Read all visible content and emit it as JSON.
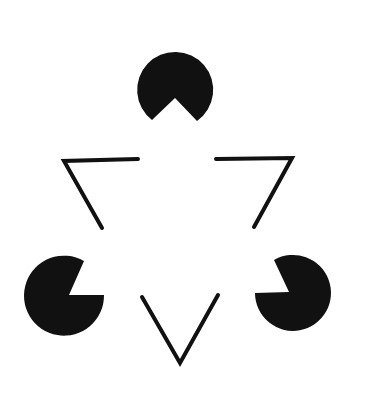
{
  "figure": {
    "name": "Kanizsa triangle illusion",
    "background": "#ffffff",
    "ink": "#111111",
    "width": 365,
    "height": 400,
    "pacmen": [
      {
        "id": "top",
        "cx": 175,
        "cy": 90,
        "r": 38
      },
      {
        "id": "left",
        "cx": 65,
        "cy": 296,
        "r": 40
      },
      {
        "id": "right",
        "cx": 293,
        "cy": 296,
        "r": 38
      }
    ],
    "line_corners": [
      {
        "id": "upper-left",
        "points": [
          [
            138,
            159
          ],
          [
            64,
            161
          ],
          [
            102,
            228
          ]
        ]
      },
      {
        "id": "upper-right",
        "points": [
          [
            216,
            159
          ],
          [
            292,
            158
          ],
          [
            254,
            227
          ]
        ]
      },
      {
        "id": "bottom",
        "points": [
          [
            142,
            297
          ],
          [
            180,
            363
          ],
          [
            218,
            295
          ]
        ]
      }
    ]
  }
}
